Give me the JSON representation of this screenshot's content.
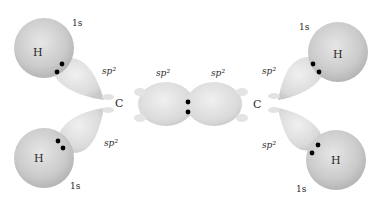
{
  "diagram": {
    "colors": {
      "background": "#ffffff",
      "orbital_fill": "#dcdcdc",
      "hydrogen_fill": "#cfcfcf",
      "electron": "#000000",
      "text": "#2a2a2a"
    },
    "carbons": [
      {
        "label": "C"
      },
      {
        "label": "C"
      }
    ],
    "hydrogens": [
      {
        "label": "H",
        "orbital": "1s",
        "position": "top-left"
      },
      {
        "label": "H",
        "orbital": "1s",
        "position": "bottom-left"
      },
      {
        "label": "H",
        "orbital": "1s",
        "position": "top-right"
      },
      {
        "label": "H",
        "orbital": "1s",
        "position": "bottom-right"
      }
    ],
    "hybrid_labels": {
      "top_left": "sp²",
      "bottom_left": "sp²",
      "center_left": "sp²",
      "center_right": "sp²",
      "top_right": "sp²",
      "bottom_right": "sp²"
    }
  }
}
